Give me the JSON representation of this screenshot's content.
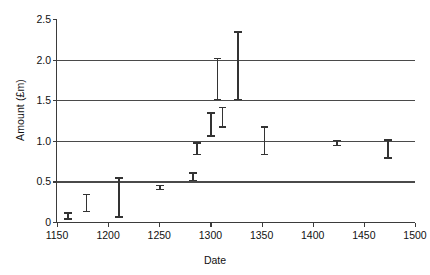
{
  "chart_data": {
    "type": "scatter",
    "title": "",
    "xlabel": "Date",
    "ylabel": "Amount (£m)",
    "xlim": [
      1150,
      1500
    ],
    "ylim": [
      0,
      2.5
    ],
    "grid": true,
    "legend": null,
    "xticks": [
      1150,
      1200,
      1250,
      1300,
      1350,
      1400,
      1450,
      1500
    ],
    "xtick_labels": [
      "1150",
      "1200",
      "1250",
      "1300",
      "1350",
      "1400",
      "1450",
      "1500"
    ],
    "yticks": [
      0,
      0.5,
      1.0,
      1.5,
      2.0,
      2.5
    ],
    "ytick_labels": [
      "0",
      "0.5",
      "1.0",
      "1.5",
      "2.0",
      "2.5"
    ],
    "gridlines_at": [
      0.5,
      1.0,
      1.5,
      2.0
    ],
    "series": [
      {
        "name": "Amount with uncertainty range",
        "marker": "error-bar",
        "color": "#333333",
        "points": [
          {
            "x": 1160,
            "y": 0.07,
            "low": 0.03,
            "high": 0.12
          },
          {
            "x": 1178,
            "y": 0.23,
            "low": 0.12,
            "high": 0.35
          },
          {
            "x": 1210,
            "y": 0.3,
            "low": 0.05,
            "high": 0.55
          },
          {
            "x": 1250,
            "y": 0.42,
            "low": 0.39,
            "high": 0.46
          },
          {
            "x": 1282,
            "y": 0.55,
            "low": 0.5,
            "high": 0.61
          },
          {
            "x": 1286,
            "y": 0.9,
            "low": 0.82,
            "high": 0.98
          },
          {
            "x": 1300,
            "y": 1.2,
            "low": 1.05,
            "high": 1.35
          },
          {
            "x": 1311,
            "y": 1.29,
            "low": 1.16,
            "high": 1.42
          },
          {
            "x": 1306,
            "y": 1.76,
            "low": 1.5,
            "high": 2.02
          },
          {
            "x": 1326,
            "y": 1.92,
            "low": 1.5,
            "high": 2.35
          },
          {
            "x": 1352,
            "y": 1.0,
            "low": 0.82,
            "high": 1.18
          },
          {
            "x": 1423,
            "y": 0.97,
            "low": 0.93,
            "high": 1.01
          },
          {
            "x": 1473,
            "y": 0.9,
            "low": 0.78,
            "high": 1.02
          }
        ]
      }
    ]
  }
}
